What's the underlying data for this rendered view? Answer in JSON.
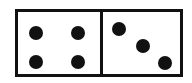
{
  "domino": {
    "left_half": {
      "value": 4
    },
    "right_half": {
      "value": 3
    },
    "pip_color": "#111111",
    "border_color": "#111111",
    "face_color": "#ffffff"
  }
}
